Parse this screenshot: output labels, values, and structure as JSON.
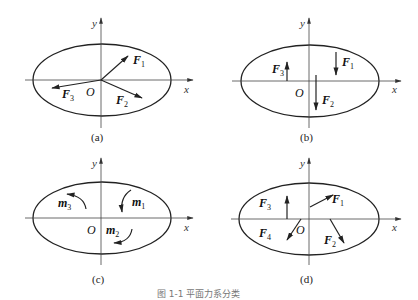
{
  "figure_caption": "图 1-1  平面力系分类",
  "axes": {
    "x": "x",
    "y": "y",
    "origin": "O"
  },
  "panels": [
    {
      "id": "a",
      "caption": "(a)",
      "forces": [
        "F",
        "F",
        "F"
      ],
      "subs": [
        "1",
        "2",
        "3"
      ]
    },
    {
      "id": "b",
      "caption": "(b)",
      "forces": [
        "F",
        "F",
        "F"
      ],
      "subs": [
        "1",
        "2",
        "3"
      ]
    },
    {
      "id": "c",
      "caption": "(c)",
      "moments": [
        "m",
        "m",
        "m"
      ],
      "subs": [
        "1",
        "2",
        "3"
      ]
    },
    {
      "id": "d",
      "caption": "(d)",
      "forces": [
        "F",
        "F",
        "F",
        "F"
      ],
      "subs": [
        "1",
        "2",
        "3",
        "4"
      ]
    }
  ]
}
